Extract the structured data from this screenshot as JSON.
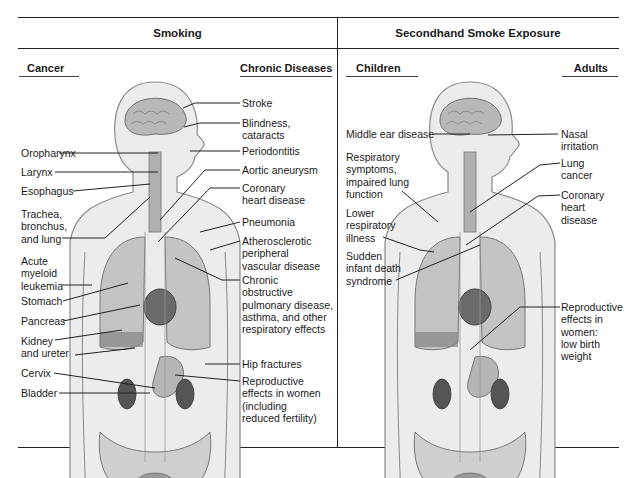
{
  "sections": {
    "left": {
      "title": "Smoking",
      "columns": {
        "left": {
          "heading": "Cancer",
          "items": [
            "Oropharynx",
            "Larynx",
            "Esophagus",
            "Trachea,\nbronchus,\nand lung",
            "Acute\nmyeloid\nleukemia",
            "Stomach",
            "Pancreas",
            "Kidney\nand ureter",
            "Cervix",
            "Bladder"
          ]
        },
        "right": {
          "heading": "Chronic Diseases",
          "items": [
            "Stroke",
            "Blindness,\ncataracts",
            "Periodontitis",
            "Aortic aneurysm",
            "Coronary\nheart disease",
            "Pneumonia",
            "Atherosclerotic\nperipheral\nvascular disease",
            "Chronic\nobstructive\npulmonary disease,\nasthma, and other\nrespiratory effects",
            "Hip fractures",
            "Reproductive\neffects in women\n(including\nreduced fertility)"
          ]
        }
      }
    },
    "right": {
      "title": "Secondhand Smoke Exposure",
      "columns": {
        "left": {
          "heading": "Children",
          "items": [
            "Middle ear disease",
            "Respiratory\nsymptoms,\nimpaired lung\nfunction",
            "Lower\nrespiratory\nillness",
            "Sudden\ninfant death\nsyndrome"
          ]
        },
        "right": {
          "heading": "Adults",
          "items": [
            "Nasal\nirritation",
            "Lung\ncancer",
            "Coronary\nheart\ndisease",
            "Reproductive\neffects in\nwomen:\nlow birth\nweight"
          ]
        }
      }
    }
  },
  "colors": {
    "line": "#222222",
    "body_fill": "#e6e6e6",
    "organ_dark": "#5a5a5a",
    "organ_mid": "#9a9a9a"
  }
}
